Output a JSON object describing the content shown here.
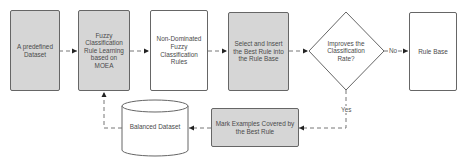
{
  "nodes": {
    "predefined_dataset": "A predefined Dataset",
    "fuzzy_rule_learning": "Fuzzy Classification Rule Learning based on MOEA",
    "non_dominated_rules": "Non-Dominated Fuzzy Classification Rules",
    "select_insert_best_rule": "Select and Insert the Best Rule into the Rule Base",
    "improves_decision": "Improves the Classification Rate?",
    "rule_base": "Rule Base",
    "mark_examples": "Mark Examples Covered by the Best Rule",
    "balanced_dataset": "Balanced Dataset"
  },
  "edge_labels": {
    "no": "No",
    "yes": "Yes"
  },
  "colors": {
    "process_fill": "#d6d6d6",
    "border": "#666666",
    "connector": "#777777",
    "text": "#4a4a4a"
  }
}
